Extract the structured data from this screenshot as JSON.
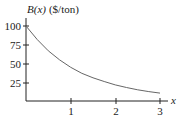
{
  "chart_data": {
    "type": "line",
    "title": "",
    "ylabel_func": "B(x)",
    "ylabel_unit": "($/ton)",
    "xlabel": "x",
    "xlim": [
      0,
      3
    ],
    "ylim": [
      0,
      100
    ],
    "x_ticks": [
      "1",
      "2",
      "3"
    ],
    "y_ticks": [
      "100",
      "75",
      "50",
      "25"
    ],
    "grid": false,
    "legend": null,
    "series": [
      {
        "name": "B(x)",
        "x": [
          0,
          0.25,
          0.5,
          0.75,
          1.0,
          1.25,
          1.5,
          1.75,
          2.0,
          2.25,
          2.5,
          2.75,
          3.0
        ],
        "y": [
          100,
          82,
          67,
          55,
          45,
          37,
          31,
          26,
          21.5,
          18,
          15,
          12.5,
          10.5
        ]
      }
    ],
    "colors": {
      "axis": "#222222",
      "curve": "#666666"
    }
  }
}
